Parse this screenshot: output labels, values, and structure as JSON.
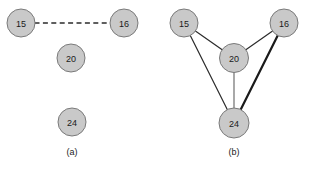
{
  "figure": {
    "background_color": "#ffffff",
    "node_fill_color": "#c9c9c9",
    "node_stroke_color": "#7a7a7a",
    "edge_color": "#2b2b2b",
    "label_color": "#1a1a1a"
  },
  "panels": [
    {
      "id": "a",
      "caption": "(a)",
      "caption_pos": {
        "x": 72,
        "y": 152
      },
      "nodes": [
        {
          "id": "15",
          "label": "15",
          "cx": 21,
          "cy": 23,
          "rx": 14,
          "ry": 14
        },
        {
          "id": "16",
          "label": "16",
          "cx": 124,
          "cy": 23,
          "rx": 14,
          "ry": 14
        },
        {
          "id": "20",
          "label": "20",
          "cx": 71,
          "cy": 58,
          "rx": 14,
          "ry": 14
        },
        {
          "id": "24",
          "label": "24",
          "cx": 72,
          "cy": 122,
          "rx": 14,
          "ry": 14
        }
      ],
      "edges": [
        {
          "from": "15",
          "to": "16",
          "style": "dashed",
          "weight": "thin"
        }
      ]
    },
    {
      "id": "b",
      "caption": "(b)",
      "caption_pos": {
        "x": 234,
        "y": 152
      },
      "nodes": [
        {
          "id": "15",
          "label": "15",
          "cx": 184,
          "cy": 23,
          "rx": 14,
          "ry": 14
        },
        {
          "id": "16",
          "label": "16",
          "cx": 284,
          "cy": 23,
          "rx": 14,
          "ry": 14
        },
        {
          "id": "20",
          "label": "20",
          "cx": 234,
          "cy": 58,
          "rx": 14.5,
          "ry": 14.5
        },
        {
          "id": "24",
          "label": "24",
          "cx": 234,
          "cy": 123,
          "rx": 15,
          "ry": 15
        }
      ],
      "edges": [
        {
          "from": "15",
          "to": "20",
          "style": "solid",
          "weight": "thin"
        },
        {
          "from": "16",
          "to": "20",
          "style": "solid",
          "weight": "thin"
        },
        {
          "from": "15",
          "to": "24",
          "style": "solid",
          "weight": "thin"
        },
        {
          "from": "20",
          "to": "24",
          "style": "solid",
          "weight": "light"
        },
        {
          "from": "16",
          "to": "24",
          "style": "solid",
          "weight": "thick"
        }
      ]
    }
  ]
}
